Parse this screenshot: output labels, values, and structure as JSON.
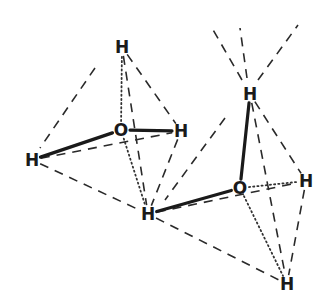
{
  "diagram": {
    "title": "",
    "colors": {
      "ink": "#1a1a1a",
      "background": "#ffffff"
    },
    "atoms": [
      {
        "id": "H1",
        "label": "H",
        "x": 122,
        "y": 47
      },
      {
        "id": "O1",
        "label": "O",
        "x": 121,
        "y": 130
      },
      {
        "id": "H2",
        "label": "H",
        "x": 181,
        "y": 131
      },
      {
        "id": "H3",
        "label": "H",
        "x": 32,
        "y": 160
      },
      {
        "id": "H4",
        "label": "H",
        "x": 148,
        "y": 214
      },
      {
        "id": "H5",
        "label": "H",
        "x": 250,
        "y": 94
      },
      {
        "id": "O2",
        "label": "O",
        "x": 240,
        "y": 188
      },
      {
        "id": "H6",
        "label": "H",
        "x": 306,
        "y": 181
      },
      {
        "id": "H7",
        "label": "H",
        "x": 287,
        "y": 284
      }
    ],
    "covalent_bonds": [
      [
        "O1",
        "H3"
      ],
      [
        "O1",
        "H2"
      ],
      [
        "O2",
        "H5"
      ],
      [
        "O2",
        "H4"
      ]
    ],
    "hydrogen_bonds": [
      [
        "O1",
        "H1"
      ],
      [
        "O1",
        "H4"
      ],
      [
        "O2",
        "H6"
      ],
      [
        "O2",
        "H7"
      ]
    ],
    "tetrahedron_edges": [
      [
        "H1",
        "H2"
      ],
      [
        "H1",
        "H4"
      ],
      [
        "H3",
        "H2"
      ],
      [
        "H3",
        "H4"
      ],
      [
        "H2",
        "H4"
      ],
      [
        "H5",
        "H6"
      ],
      [
        "H5",
        "H7"
      ],
      [
        "H4",
        "H6"
      ],
      [
        "H4",
        "H7"
      ],
      [
        "H6",
        "H7"
      ]
    ],
    "extension_lines": [
      {
        "x1": 95,
        "y1": 68,
        "x2": 40,
        "y2": 148
      },
      {
        "x1": 242,
        "y1": 80,
        "x2": 212,
        "y2": 28
      },
      {
        "x1": 247,
        "y1": 78,
        "x2": 240,
        "y2": 28
      },
      {
        "x1": 258,
        "y1": 80,
        "x2": 298,
        "y2": 25
      },
      {
        "x1": 225,
        "y1": 118,
        "x2": 165,
        "y2": 200
      }
    ]
  }
}
